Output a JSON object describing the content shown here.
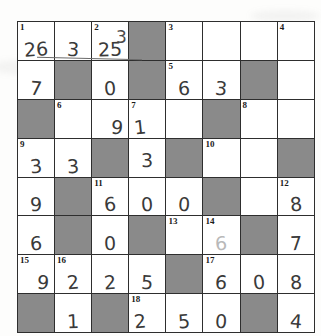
{
  "page": {
    "kind": "number-crossword",
    "rows": 8,
    "cols": 8,
    "ink_color": "#3a3a3a",
    "block_color": "#8a8a8a",
    "paper_color": "#fdfdfc",
    "grid_line_color": "#2e2e2e"
  },
  "annotations": {
    "row1_crossed_out": "3",
    "row1_crossed_out_2": "25",
    "row1_overwrite_note": "2"
  },
  "grid": [
    [
      {
        "clue": "1",
        "value": "26",
        "block": false,
        "style": "crossed"
      },
      {
        "clue": "",
        "value": "3",
        "block": false,
        "style": "crossed"
      },
      {
        "clue": "2",
        "value": "25",
        "block": false,
        "style": "crossed"
      },
      {
        "clue": "",
        "value": "",
        "block": true,
        "style": ""
      },
      {
        "clue": "3",
        "value": "",
        "block": false,
        "style": ""
      },
      {
        "clue": "",
        "value": "",
        "block": false,
        "style": ""
      },
      {
        "clue": "",
        "value": "",
        "block": false,
        "style": ""
      },
      {
        "clue": "4",
        "value": "",
        "block": false,
        "style": ""
      }
    ],
    [
      {
        "clue": "",
        "value": "7",
        "block": false,
        "style": ""
      },
      {
        "clue": "",
        "value": "",
        "block": true,
        "style": ""
      },
      {
        "clue": "",
        "value": "0",
        "block": false,
        "style": ""
      },
      {
        "clue": "",
        "value": "",
        "block": true,
        "style": ""
      },
      {
        "clue": "5",
        "value": "6",
        "block": false,
        "style": ""
      },
      {
        "clue": "",
        "value": "3",
        "block": false,
        "style": ""
      },
      {
        "clue": "",
        "value": "",
        "block": true,
        "style": ""
      },
      {
        "clue": "",
        "value": "",
        "block": false,
        "style": ""
      }
    ],
    [
      {
        "clue": "",
        "value": "",
        "block": true,
        "style": ""
      },
      {
        "clue": "6",
        "value": "",
        "block": false,
        "style": ""
      },
      {
        "clue": "",
        "value": "9",
        "block": false,
        "style": "right"
      },
      {
        "clue": "7",
        "value": "1",
        "block": false,
        "style": "left"
      },
      {
        "clue": "",
        "value": "",
        "block": false,
        "style": ""
      },
      {
        "clue": "",
        "value": "",
        "block": true,
        "style": ""
      },
      {
        "clue": "8",
        "value": "",
        "block": false,
        "style": ""
      },
      {
        "clue": "",
        "value": "",
        "block": false,
        "style": ""
      }
    ],
    [
      {
        "clue": "9",
        "value": "3",
        "block": false,
        "style": ""
      },
      {
        "clue": "",
        "value": "3",
        "block": false,
        "style": ""
      },
      {
        "clue": "",
        "value": "",
        "block": true,
        "style": ""
      },
      {
        "clue": "",
        "value": "3",
        "block": false,
        "style": "mid"
      },
      {
        "clue": "",
        "value": "",
        "block": true,
        "style": ""
      },
      {
        "clue": "10",
        "value": "",
        "block": false,
        "style": ""
      },
      {
        "clue": "",
        "value": "",
        "block": false,
        "style": ""
      },
      {
        "clue": "",
        "value": "",
        "block": true,
        "style": ""
      }
    ],
    [
      {
        "clue": "",
        "value": "9",
        "block": false,
        "style": ""
      },
      {
        "clue": "",
        "value": "",
        "block": true,
        "style": ""
      },
      {
        "clue": "11",
        "value": "6",
        "block": false,
        "style": ""
      },
      {
        "clue": "",
        "value": "0",
        "block": false,
        "style": ""
      },
      {
        "clue": "",
        "value": "0",
        "block": false,
        "style": ""
      },
      {
        "clue": "",
        "value": "",
        "block": true,
        "style": ""
      },
      {
        "clue": "",
        "value": "",
        "block": false,
        "style": ""
      },
      {
        "clue": "12",
        "value": "8",
        "block": false,
        "style": ""
      }
    ],
    [
      {
        "clue": "",
        "value": "6",
        "block": false,
        "style": ""
      },
      {
        "clue": "",
        "value": "",
        "block": true,
        "style": ""
      },
      {
        "clue": "",
        "value": "0",
        "block": false,
        "style": ""
      },
      {
        "clue": "",
        "value": "",
        "block": true,
        "style": ""
      },
      {
        "clue": "13",
        "value": "",
        "block": false,
        "style": ""
      },
      {
        "clue": "14",
        "value": "6",
        "block": false,
        "style": "faint"
      },
      {
        "clue": "",
        "value": "",
        "block": true,
        "style": ""
      },
      {
        "clue": "",
        "value": "7",
        "block": false,
        "style": ""
      }
    ],
    [
      {
        "clue": "15",
        "value": "9",
        "block": false,
        "style": "right"
      },
      {
        "clue": "16",
        "value": "2",
        "block": false,
        "style": ""
      },
      {
        "clue": "",
        "value": "2",
        "block": false,
        "style": ""
      },
      {
        "clue": "",
        "value": "5",
        "block": false,
        "style": ""
      },
      {
        "clue": "",
        "value": "",
        "block": true,
        "style": ""
      },
      {
        "clue": "17",
        "value": "6",
        "block": false,
        "style": ""
      },
      {
        "clue": "",
        "value": "0",
        "block": false,
        "style": ""
      },
      {
        "clue": "",
        "value": "8",
        "block": false,
        "style": ""
      }
    ],
    [
      {
        "clue": "",
        "value": "",
        "block": true,
        "style": ""
      },
      {
        "clue": "",
        "value": "1",
        "block": false,
        "style": ""
      },
      {
        "clue": "",
        "value": "",
        "block": true,
        "style": ""
      },
      {
        "clue": "18",
        "value": "2",
        "block": false,
        "style": "left"
      },
      {
        "clue": "",
        "value": "5",
        "block": false,
        "style": ""
      },
      {
        "clue": "",
        "value": "0",
        "block": false,
        "style": ""
      },
      {
        "clue": "",
        "value": "",
        "block": true,
        "style": ""
      },
      {
        "clue": "",
        "value": "4",
        "block": false,
        "style": ""
      }
    ]
  ]
}
